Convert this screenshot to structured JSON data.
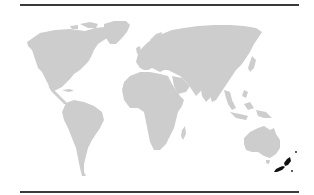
{
  "map": {
    "type": "world-locator",
    "highlighted_region": "New Zealand",
    "colors": {
      "land": "#cdcdcd",
      "highlight": "#111111",
      "background": "#ffffff",
      "rule": "#3a3a3a"
    }
  }
}
